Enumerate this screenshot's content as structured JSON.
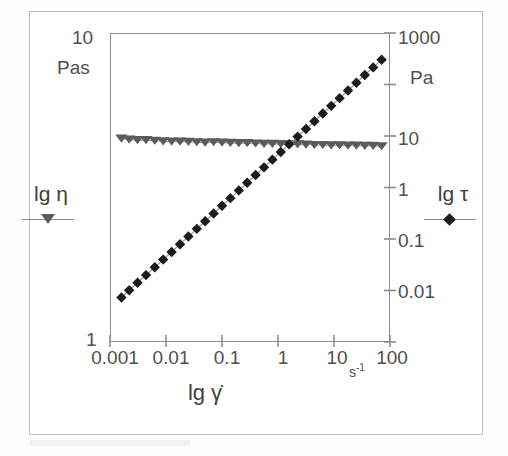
{
  "figure": {
    "background_color": "#ffffff",
    "border_color": "#bdbdbd",
    "axis_color": "#8d8d8d"
  },
  "chart_data": {
    "type": "scatter",
    "title": "",
    "subtitle": "",
    "xlabel": "lg γ̇",
    "x_unit": "s",
    "x_unit_exponent": "-1",
    "xscale": "log",
    "xlim": [
      0.001,
      100
    ],
    "x_ticks": [
      0.001,
      0.01,
      0.1,
      1,
      10,
      100
    ],
    "x_tick_labels": [
      "0.001",
      "0.01",
      "0.1",
      "1",
      "10",
      "100"
    ],
    "grid": false,
    "legend_position": "outside-left-and-right",
    "left_axis": {
      "label": "lg η",
      "unit": "Pas",
      "scale": "log",
      "ylim": [
        1,
        10
      ],
      "ticks": [
        1,
        10
      ],
      "tick_labels": [
        "1",
        "10"
      ],
      "max_label": "10",
      "min_label": "1"
    },
    "right_axis": {
      "label": "lg τ",
      "unit": "Pa",
      "scale": "log",
      "ylim": [
        0.001,
        1000
      ],
      "ticks": [
        1000,
        100,
        10,
        1,
        0.1,
        0.01,
        0.001
      ],
      "tick_labels": [
        "1000",
        "",
        "10",
        "1",
        "0.1",
        "0.01",
        ""
      ],
      "max_label": "1000"
    },
    "series": [
      {
        "name": "lg η",
        "marker": "triangle-down",
        "color": "#5b5b5b",
        "axis": "left",
        "line": true,
        "x": [
          0.0016,
          0.0022,
          0.0031,
          0.0044,
          0.0063,
          0.0089,
          0.0126,
          0.0178,
          0.0251,
          0.0355,
          0.05,
          0.0708,
          0.1,
          0.141,
          0.2,
          0.282,
          0.398,
          0.562,
          0.794,
          1.12,
          1.58,
          2.24,
          3.16,
          4.47,
          6.31,
          8.91,
          12.6,
          17.8,
          25.1,
          35.5,
          50.1,
          70.8
        ],
        "y": [
          4.55,
          4.52,
          4.5,
          4.5,
          4.48,
          4.46,
          4.45,
          4.45,
          4.44,
          4.43,
          4.42,
          4.43,
          4.42,
          4.41,
          4.4,
          4.4,
          4.39,
          4.38,
          4.38,
          4.37,
          4.36,
          4.36,
          4.35,
          4.34,
          4.34,
          4.33,
          4.33,
          4.32,
          4.32,
          4.31,
          4.31,
          4.3
        ]
      },
      {
        "name": "lg τ",
        "marker": "diamond",
        "color": "#1c1c1c",
        "axis": "right",
        "line": true,
        "x": [
          0.0016,
          0.0022,
          0.0031,
          0.0044,
          0.0063,
          0.0089,
          0.0126,
          0.0178,
          0.0251,
          0.0355,
          0.05,
          0.0708,
          0.1,
          0.141,
          0.2,
          0.282,
          0.398,
          0.562,
          0.794,
          1.12,
          1.58,
          2.24,
          3.16,
          4.47,
          6.31,
          8.91,
          12.6,
          17.8,
          25.1,
          35.5,
          50.1,
          70.8
        ],
        "y": [
          0.0073,
          0.0101,
          0.0141,
          0.0199,
          0.0283,
          0.0398,
          0.0561,
          0.0792,
          0.1115,
          0.1573,
          0.221,
          0.3134,
          0.4418,
          0.6218,
          0.8793,
          1.2382,
          1.7471,
          2.4613,
          3.4757,
          4.8949,
          6.8921,
          9.7284,
          13.7127,
          19.3355,
          27.2753,
          38.5,
          54.3,
          76.6,
          108.1,
          152.5,
          215.0,
          303.2
        ]
      }
    ],
    "annotations": [
      {
        "text": "curves cross near 5 s^-1",
        "visible": false
      }
    ]
  },
  "left_legend": {
    "label": "lg η",
    "marker_name": "triangle-down-marker"
  },
  "right_legend": {
    "label": "lg τ",
    "marker_name": "diamond-marker"
  }
}
